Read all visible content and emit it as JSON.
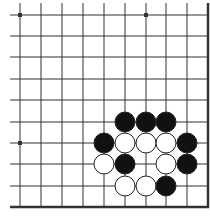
{
  "diagram": {
    "type": "go-board-fragment",
    "corner": "bottom-right",
    "colors": {
      "background": "#ffffff",
      "line": "#333333",
      "black_stone": "#111111",
      "white_stone": "#ffffff",
      "stone_outline": "#222222"
    },
    "grid": {
      "x": [
        20,
        41,
        62,
        83,
        104,
        125,
        146,
        166,
        187
      ],
      "y": [
        15,
        36,
        57,
        79,
        100,
        122,
        143,
        164,
        186
      ],
      "right_edge_x": 208,
      "bottom_edge_y": 207,
      "line_start_x": 10,
      "line_start_y": 3
    },
    "star_points": [
      {
        "col": 0,
        "row": 0
      },
      {
        "col": 6,
        "row": 0
      },
      {
        "col": 0,
        "row": 6
      }
    ],
    "stones": [
      {
        "color": "black",
        "col": 5,
        "row": 5
      },
      {
        "color": "black",
        "col": 6,
        "row": 5
      },
      {
        "color": "black",
        "col": 7,
        "row": 5
      },
      {
        "color": "black",
        "col": 4,
        "row": 6
      },
      {
        "color": "white",
        "col": 5,
        "row": 6
      },
      {
        "color": "white",
        "col": 6,
        "row": 6
      },
      {
        "color": "white",
        "col": 7,
        "row": 6
      },
      {
        "color": "black",
        "col": 8,
        "row": 6
      },
      {
        "color": "white",
        "col": 4,
        "row": 7
      },
      {
        "color": "black",
        "col": 5,
        "row": 7
      },
      {
        "color": "white",
        "col": 7,
        "row": 7
      },
      {
        "color": "black",
        "col": 8,
        "row": 7
      },
      {
        "color": "white",
        "col": 5,
        "row": 8
      },
      {
        "color": "white",
        "col": 6,
        "row": 8
      },
      {
        "color": "black",
        "col": 7,
        "row": 8
      }
    ],
    "stone_radius": 10
  }
}
